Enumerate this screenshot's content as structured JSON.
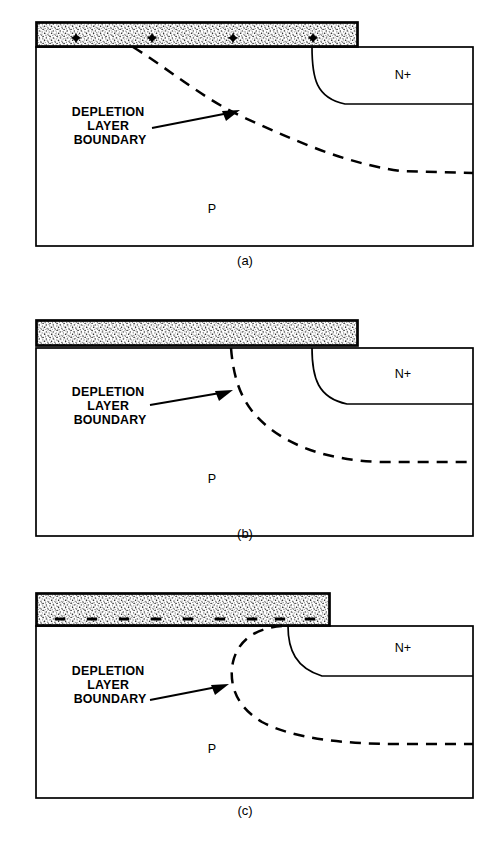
{
  "figure": {
    "background_color": "#ffffff",
    "ink_color": "#000000",
    "width": 497,
    "height": 842
  },
  "labels": {
    "callout_line1": "DEPLETION",
    "callout_line2": "LAYER",
    "callout_line3": "BOUNDARY",
    "region_p": "P",
    "region_n_plus": "N+"
  },
  "panels": [
    {
      "id": "panel-a",
      "caption": "(a)",
      "caption_x": 245,
      "caption_y": 265,
      "body": {
        "x": 36,
        "y": 47,
        "width": 437,
        "height": 199
      },
      "gate": {
        "x": 36,
        "y": 22,
        "width": 322,
        "height": 25,
        "fill": "#f2f2f2"
      },
      "charge": {
        "type": "plus",
        "count": 4,
        "x_positions": [
          76,
          152,
          233,
          313
        ],
        "y": 38
      },
      "junction": {
        "path": "M 312 47 C 312 78, 316 98, 345 104 L 473 104",
        "n_label_x": 403,
        "n_label_y": 79
      },
      "depletion": {
        "path": "M 133 47 C 170 70, 205 100, 245 118 C 292 139, 340 162, 400 171 L 473 173"
      },
      "arrow": {
        "line": "M 152 128 L 234 112",
        "head": "M 240 110 L 222 111 L 226 121 Z"
      },
      "callout": {
        "x": 110,
        "y": 116,
        "line_height": 14
      },
      "p_label": {
        "x": 212,
        "y": 213
      }
    },
    {
      "id": "panel-b",
      "caption": "(b)",
      "caption_x": 245,
      "caption_y": 538,
      "body": {
        "x": 36,
        "y": 348,
        "width": 437,
        "height": 188
      },
      "gate": {
        "x": 36,
        "y": 320,
        "width": 322,
        "height": 26,
        "fill": "#f2f2f2"
      },
      "charge": {
        "type": "none",
        "count": 0,
        "x_positions": [],
        "y": 0
      },
      "junction": {
        "path": "M 312 348 C 312 378, 318 398, 347 404 L 473 404",
        "n_label_x": 403,
        "n_label_y": 378
      },
      "depletion": {
        "path": "M 231 348 C 233 372, 238 393, 252 411 C 276 441, 320 460, 380 462 L 473 462"
      },
      "arrow": {
        "line": "M 150 405 L 226 392",
        "head": "M 233 390 L 215 391 L 219 401 Z"
      },
      "callout": {
        "x": 110,
        "y": 396,
        "line_height": 14
      },
      "p_label": {
        "x": 212,
        "y": 483
      }
    },
    {
      "id": "panel-c",
      "caption": "(c)",
      "caption_x": 245,
      "caption_y": 815,
      "body": {
        "x": 36,
        "y": 626,
        "width": 437,
        "height": 172
      },
      "gate": {
        "x": 36,
        "y": 593,
        "width": 294,
        "height": 33,
        "fill": "#f2f2f2"
      },
      "charge": {
        "type": "minus",
        "count": 9,
        "x_positions": [
          60,
          92,
          124,
          156,
          188,
          220,
          252,
          280,
          310
        ],
        "y": 619
      },
      "junction": {
        "path": "M 288 626 C 288 650, 296 668, 322 676 L 473 676",
        "n_label_x": 403,
        "n_label_y": 652
      },
      "depletion": {
        "path": "M 282 626 C 256 628, 238 640, 233 662 C 228 686, 238 708, 262 722 C 292 738, 340 744, 400 744 L 473 744"
      },
      "arrow": {
        "line": "M 150 700 L 222 686",
        "head": "M 229 684 L 211 685 L 215 695 Z"
      },
      "callout": {
        "x": 110,
        "y": 675,
        "line_height": 14
      },
      "p_label": {
        "x": 212,
        "y": 753
      }
    }
  ]
}
